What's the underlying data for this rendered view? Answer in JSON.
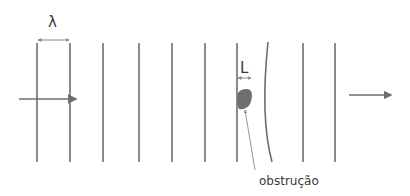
{
  "diagram": {
    "labels": {
      "wavelength": "λ",
      "obstruction_size": "L",
      "obstruction": "obstrução"
    },
    "colors": {
      "line": "#6e6e6e",
      "obstruction": "#6f6f6f",
      "text": "#3a3a3a",
      "pointer": "#8a8a8a"
    },
    "wavefronts_straight_x": [
      37,
      70,
      103,
      139,
      172,
      205,
      237,
      303,
      335
    ],
    "wavefront_curved": "after obstruction"
  }
}
